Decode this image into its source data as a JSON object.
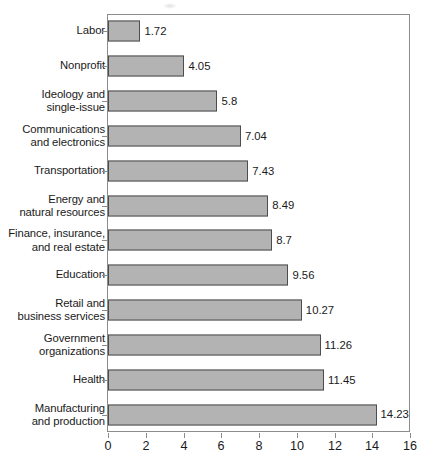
{
  "chart_data": {
    "type": "bar",
    "orientation": "horizontal",
    "title": "",
    "xlabel": "",
    "ylabel": "",
    "xlim": [
      0,
      16
    ],
    "xticks": [
      0,
      2,
      4,
      6,
      8,
      10,
      12,
      14,
      16
    ],
    "xtick_labels": [
      "0",
      "2",
      "4",
      "6",
      "8",
      "10",
      "12",
      "14",
      "16"
    ],
    "grid": false,
    "legend": false,
    "bar_color": "#b3b3b3",
    "bar_edge_color": "#4d4d4d",
    "frame_color": "#8c8c8c",
    "background": "#ffffff",
    "categories": [
      "Labor",
      "Nonprofit",
      "Ideology and single-issue",
      "Communications and electronics",
      "Transportation",
      "Energy and natural resources",
      "Finance, insurance, and real estate",
      "Education",
      "Retail and business services",
      "Government organizations",
      "Health",
      "Manufacturing and production"
    ],
    "values": [
      1.72,
      4.05,
      5.8,
      7.04,
      7.43,
      8.49,
      8.7,
      9.56,
      10.27,
      11.26,
      11.45,
      14.23
    ],
    "value_labels": [
      "1.72",
      "4.05",
      "5.8",
      "7.04",
      "7.43",
      "8.49",
      "8.7",
      "9.56",
      "10.27",
      "11.26",
      "11.45",
      "14.23"
    ],
    "category_label_lines": [
      [
        "Labor"
      ],
      [
        "Nonprofit"
      ],
      [
        "Ideology and",
        "single-issue"
      ],
      [
        "Communications",
        "and electronics"
      ],
      [
        "Transportation"
      ],
      [
        "Energy and",
        "natural resources"
      ],
      [
        "Finance, insurance,",
        "and real estate"
      ],
      [
        "Education"
      ],
      [
        "Retail and",
        "business services"
      ],
      [
        "Government",
        "organizations"
      ],
      [
        "Health"
      ],
      [
        "Manufacturing",
        "and production"
      ]
    ]
  }
}
